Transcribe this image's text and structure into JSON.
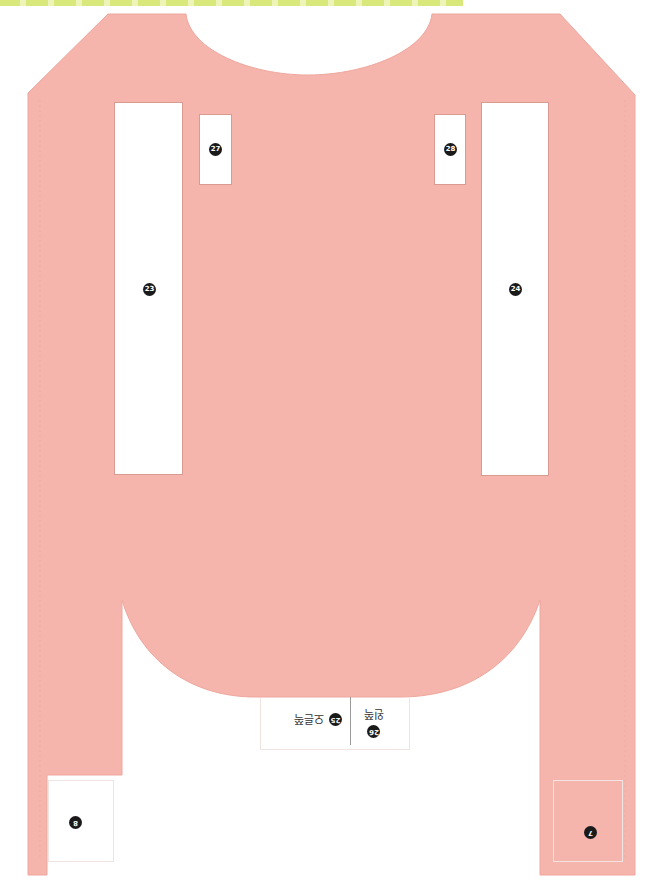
{
  "template": {
    "colors": {
      "fabric": "#f5b5ac",
      "fabric_edge": "#d99a92",
      "strip": "#d9e87a",
      "paper": "#ffffff"
    }
  },
  "slots": [
    {
      "id": "slot-27",
      "label": "27"
    },
    {
      "id": "slot-28",
      "label": "28"
    },
    {
      "id": "slot-23",
      "label": "23"
    },
    {
      "id": "slot-24",
      "label": "24"
    }
  ],
  "flaps": {
    "left_leg": {
      "label": "8"
    },
    "right_leg": {
      "label": "7"
    }
  },
  "bottom_labels": {
    "left": {
      "number": "25",
      "text": "오른쪽"
    },
    "right": {
      "number": "26",
      "text": "왼쪽"
    }
  }
}
